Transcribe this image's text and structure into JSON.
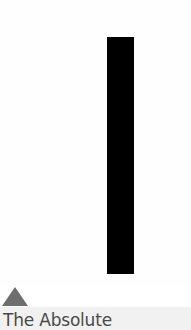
{
  "card": {
    "cover": {
      "background": "#fefefe",
      "bar_color": "#000000"
    },
    "indicator": {
      "icon": "triangle-up-icon",
      "color": "#6e6e6e"
    },
    "caption": {
      "title": "The Absolute",
      "band_color": "#f1f1f1",
      "text_color": "#4a4a4a"
    }
  }
}
